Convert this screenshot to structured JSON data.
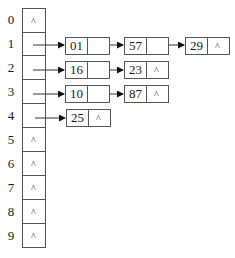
{
  "diagram": {
    "null_symbol": "^",
    "buckets": [
      {
        "index": "0",
        "chain": []
      },
      {
        "index": "1",
        "chain": [
          "01",
          "57",
          "29"
        ]
      },
      {
        "index": "2",
        "chain": [
          "16",
          "23"
        ]
      },
      {
        "index": "3",
        "chain": [
          "10",
          "87"
        ]
      },
      {
        "index": "4",
        "chain": [
          "25"
        ]
      },
      {
        "index": "5",
        "chain": []
      },
      {
        "index": "6",
        "chain": []
      },
      {
        "index": "7",
        "chain": []
      },
      {
        "index": "8",
        "chain": []
      },
      {
        "index": "9",
        "chain": []
      }
    ]
  }
}
